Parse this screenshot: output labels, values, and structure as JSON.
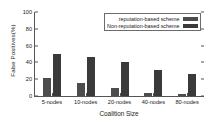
{
  "chart_data": {
    "type": "bar",
    "title": "",
    "xlabel": "Coalition Size",
    "ylabel": "False Positives(%)",
    "categories": [
      "5-nodes",
      "10-nodes",
      "20-nodes",
      "40-nodes",
      "80-nodes"
    ],
    "series": [
      {
        "name": "reputation-based scheme",
        "values": [
          21,
          16,
          10,
          4,
          2.5
        ],
        "color": "#4d4d4d"
      },
      {
        "name": "Non-reputation-based scheme",
        "values": [
          50,
          46,
          40,
          31,
          26
        ],
        "color": "#3a3a3a"
      }
    ],
    "ylim": [
      0,
      100
    ],
    "yticks": [
      0,
      20,
      40,
      60,
      80,
      100
    ],
    "ytick_labels": [
      "0",
      "20",
      "40",
      "60",
      "80",
      "100"
    ],
    "grid": false,
    "legend_position": "top-right"
  },
  "legend": {
    "entries": [
      {
        "label": "reputation-based scheme"
      },
      {
        "label": "Non-reputation-based scheme"
      }
    ]
  },
  "axes": {
    "y_title": "False Positives(%)",
    "x_title": "Coalition Size"
  }
}
